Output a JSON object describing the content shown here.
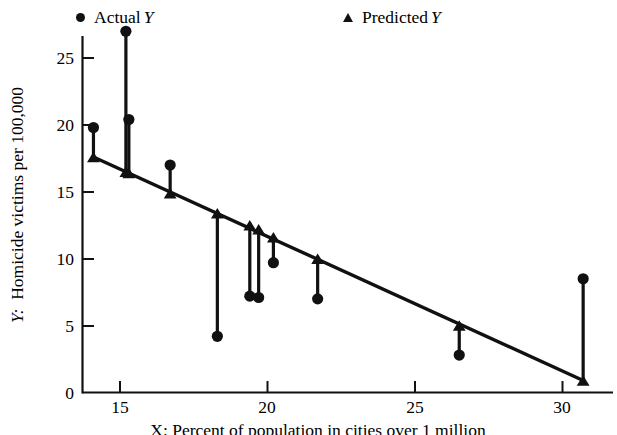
{
  "figure": {
    "background_color": "#ffffff",
    "ink_color": "#111111"
  },
  "legend": {
    "position": "top",
    "entries": [
      {
        "marker": "circle-marker-icon",
        "label": "Actual",
        "italic_symbol": "Y"
      },
      {
        "marker": "triangle-marker-icon",
        "label": "Predicted",
        "italic_symbol": "Y"
      }
    ]
  },
  "axes": {
    "y": {
      "title_prefix": "Y:",
      "title": "Homicide victims per 100,000",
      "ticks": [
        "0",
        "5",
        "10",
        "15",
        "20",
        "25"
      ],
      "limits": [
        0,
        27.8
      ]
    },
    "x": {
      "ticks": [
        "15",
        "20",
        "25",
        "30"
      ],
      "limits": [
        13.2,
        31.6
      ],
      "caption": "X: Percent of population in cities over 1 million"
    }
  },
  "chart_data": {
    "type": "scatter",
    "title": "",
    "xlabel": "X: Percent of population in cities over 1 million",
    "ylabel": "Y: Homicide victims per 100,000",
    "xlim": [
      13.2,
      31.6
    ],
    "ylim": [
      0,
      27.8
    ],
    "xticks": [
      15,
      20,
      25,
      30
    ],
    "yticks": [
      0,
      5,
      10,
      15,
      20,
      25
    ],
    "grid": false,
    "legend_position": "top",
    "series": [
      {
        "name": "Actual Y",
        "marker": "circle",
        "x": [
          14.1,
          15.2,
          15.3,
          16.7,
          18.3,
          19.4,
          19.7,
          20.2,
          21.7,
          26.5,
          30.7
        ],
        "values": [
          19.8,
          27.0,
          20.4,
          17.0,
          4.2,
          7.2,
          7.1,
          9.7,
          7.0,
          2.8,
          8.5
        ]
      },
      {
        "name": "Predicted Y",
        "marker": "triangle",
        "x": [
          14.1,
          15.2,
          15.3,
          16.7,
          18.3,
          19.4,
          19.7,
          20.2,
          21.7,
          26.5,
          30.7
        ],
        "values": [
          17.6,
          16.5,
          16.4,
          14.9,
          13.4,
          12.5,
          12.2,
          11.6,
          10.0,
          5.0,
          0.9
        ]
      }
    ],
    "regression_line": {
      "description": "fitted least-squares line through predicted values",
      "x_start": 14.1,
      "y_start": 17.6,
      "x_end": 30.7,
      "y_end": 0.9
    },
    "residual_segments": [
      {
        "x": 14.1,
        "actual": 19.8,
        "predicted": 17.6
      },
      {
        "x": 15.2,
        "actual": 27.0,
        "predicted": 16.5
      },
      {
        "x": 15.3,
        "actual": 20.4,
        "predicted": 16.4
      },
      {
        "x": 16.7,
        "actual": 17.0,
        "predicted": 14.9
      },
      {
        "x": 18.3,
        "actual": 4.2,
        "predicted": 13.4
      },
      {
        "x": 19.4,
        "actual": 7.2,
        "predicted": 12.5
      },
      {
        "x": 19.7,
        "actual": 7.1,
        "predicted": 12.2
      },
      {
        "x": 20.2,
        "actual": 9.7,
        "predicted": 11.6
      },
      {
        "x": 21.7,
        "actual": 7.0,
        "predicted": 10.0
      },
      {
        "x": 26.5,
        "actual": 2.8,
        "predicted": 5.0
      },
      {
        "x": 30.7,
        "actual": 8.5,
        "predicted": 0.9
      }
    ]
  }
}
